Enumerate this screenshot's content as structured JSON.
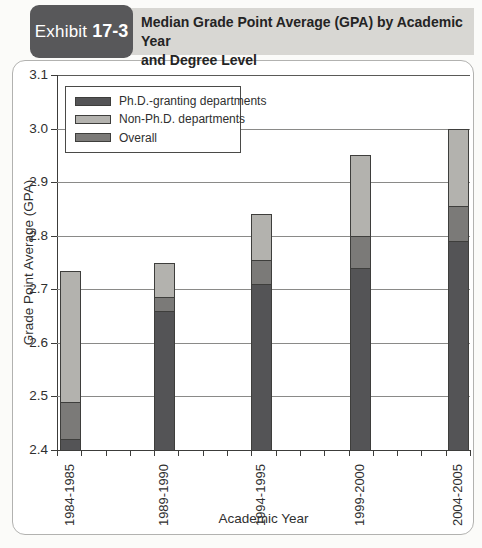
{
  "exhibit": {
    "label": "Exhibit",
    "number": "17-3",
    "title_lines": [
      "Median Grade Point Average (GPA) by Academic Year",
      "and Degree Level"
    ]
  },
  "chart_data": {
    "type": "bar",
    "subtype": "overlapped-bars",
    "title": "Median Grade Point Average (GPA) by Academic Year and Degree Level",
    "xlabel": "Academic Year",
    "ylabel": "Grade Point Average (GPA)",
    "ylim": [
      2.4,
      3.1
    ],
    "yticks": [
      2.4,
      2.5,
      2.6,
      2.7,
      2.8,
      2.9,
      3.0,
      3.1
    ],
    "grid": true,
    "legend_position": "top-left",
    "categories": [
      "1984-1985",
      "1989-1990",
      "1994-1995",
      "1999-2000",
      "2004-2005"
    ],
    "series": [
      {
        "name": "Ph.D.-granting departments",
        "color": "#545456",
        "values": [
          2.42,
          2.66,
          2.71,
          2.74,
          2.79
        ]
      },
      {
        "name": "Non-Ph.D. departments",
        "color": "#b3b2ae",
        "values": [
          2.735,
          2.75,
          2.84,
          2.95,
          3.0
        ]
      },
      {
        "name": "Overall",
        "color": "#7b7a78",
        "values": [
          2.49,
          2.685,
          2.755,
          2.8,
          2.855
        ]
      }
    ]
  },
  "colors": {
    "header_box": "#58585a",
    "header_band": "#d8d7d3",
    "bar_border": "#3e3e3c",
    "gridline": "#8a8a88"
  }
}
